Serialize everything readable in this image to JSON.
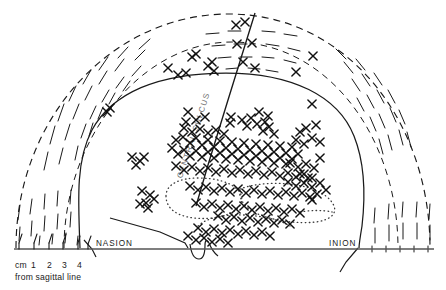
{
  "figure": {
    "kind": "anatomical-diagram",
    "view": "superior view of head, left hemisphere mapped",
    "background_color": "#ffffff",
    "ink_color": "#1a1a1a",
    "sulcus_label_color": "#6f6f6f"
  },
  "labels": {
    "nasion": "NASION",
    "inion": "INION",
    "central_sulcus": "CENTRAL SULCUS",
    "scale_unit": "cm",
    "scale_ticks": [
      "1",
      "2",
      "3",
      "4"
    ],
    "scale_caption": "from sagittal line"
  },
  "chart_data": {
    "type": "scatter",
    "title": "",
    "xlabel": "from sagittal line (cm)",
    "ylabel": "",
    "marker": "x-cross",
    "grid": false,
    "legend": null,
    "annotations": [
      {
        "text": "NASION",
        "x": 96,
        "y": 246
      },
      {
        "text": "INION",
        "x": 329,
        "y": 246
      },
      {
        "text": "CENTRAL SULCUS",
        "x": 196,
        "y": 110,
        "rotation": 67
      }
    ],
    "axis_ranges": {
      "x": [
        0,
        446
      ],
      "y": [
        0,
        290
      ]
    },
    "n_points": 186,
    "points": [
      [
        168,
        68
      ],
      [
        192,
        57
      ],
      [
        196,
        54
      ],
      [
        178,
        75
      ],
      [
        186,
        73
      ],
      [
        208,
        66
      ],
      [
        214,
        71
      ],
      [
        212,
        62
      ],
      [
        236,
        25
      ],
      [
        243,
        62
      ],
      [
        255,
        68
      ],
      [
        245,
        22
      ],
      [
        237,
        44
      ],
      [
        252,
        43
      ],
      [
        296,
        72
      ],
      [
        313,
        56
      ],
      [
        110,
        108
      ],
      [
        107,
        112
      ],
      [
        188,
        112
      ],
      [
        231,
        117
      ],
      [
        265,
        122
      ],
      [
        316,
        125
      ],
      [
        312,
        104
      ],
      [
        186,
        122
      ],
      [
        196,
        120
      ],
      [
        205,
        117
      ],
      [
        230,
        123
      ],
      [
        242,
        120
      ],
      [
        247,
        126
      ],
      [
        251,
        118
      ],
      [
        257,
        124
      ],
      [
        263,
        131
      ],
      [
        269,
        127
      ],
      [
        274,
        134
      ],
      [
        259,
        112
      ],
      [
        268,
        116
      ],
      [
        176,
        140
      ],
      [
        183,
        137
      ],
      [
        190,
        143
      ],
      [
        196,
        138
      ],
      [
        202,
        145
      ],
      [
        208,
        140
      ],
      [
        214,
        147
      ],
      [
        220,
        141
      ],
      [
        226,
        148
      ],
      [
        232,
        142
      ],
      [
        238,
        149
      ],
      [
        244,
        143
      ],
      [
        250,
        150
      ],
      [
        256,
        144
      ],
      [
        262,
        151
      ],
      [
        268,
        145
      ],
      [
        274,
        152
      ],
      [
        280,
        146
      ],
      [
        286,
        153
      ],
      [
        292,
        147
      ],
      [
        298,
        154
      ],
      [
        172,
        148
      ],
      [
        178,
        154
      ],
      [
        184,
        150
      ],
      [
        190,
        156
      ],
      [
        196,
        151
      ],
      [
        202,
        157
      ],
      [
        208,
        152
      ],
      [
        214,
        158
      ],
      [
        220,
        153
      ],
      [
        226,
        159
      ],
      [
        232,
        154
      ],
      [
        238,
        160
      ],
      [
        244,
        155
      ],
      [
        250,
        161
      ],
      [
        256,
        156
      ],
      [
        262,
        162
      ],
      [
        268,
        157
      ],
      [
        274,
        163
      ],
      [
        280,
        158
      ],
      [
        286,
        164
      ],
      [
        292,
        159
      ],
      [
        184,
        128
      ],
      [
        192,
        132
      ],
      [
        200,
        129
      ],
      [
        208,
        133
      ],
      [
        216,
        130
      ],
      [
        224,
        134
      ],
      [
        300,
        132
      ],
      [
        306,
        128
      ],
      [
        296,
        140
      ],
      [
        304,
        144
      ],
      [
        312,
        138
      ],
      [
        320,
        142
      ],
      [
        132,
        157
      ],
      [
        140,
        161
      ],
      [
        136,
        165
      ],
      [
        144,
        157
      ],
      [
        176,
        166
      ],
      [
        184,
        170
      ],
      [
        192,
        167
      ],
      [
        200,
        171
      ],
      [
        208,
        168
      ],
      [
        216,
        172
      ],
      [
        224,
        169
      ],
      [
        232,
        173
      ],
      [
        240,
        170
      ],
      [
        248,
        174
      ],
      [
        256,
        171
      ],
      [
        264,
        175
      ],
      [
        272,
        172
      ],
      [
        280,
        176
      ],
      [
        288,
        173
      ],
      [
        296,
        177
      ],
      [
        304,
        174
      ],
      [
        312,
        178
      ],
      [
        142,
        191
      ],
      [
        150,
        195
      ],
      [
        146,
        203
      ],
      [
        154,
        199
      ],
      [
        190,
        186
      ],
      [
        198,
        190
      ],
      [
        206,
        187
      ],
      [
        214,
        191
      ],
      [
        222,
        188
      ],
      [
        230,
        192
      ],
      [
        238,
        189
      ],
      [
        246,
        193
      ],
      [
        254,
        190
      ],
      [
        262,
        194
      ],
      [
        270,
        191
      ],
      [
        278,
        195
      ],
      [
        286,
        192
      ],
      [
        294,
        196
      ],
      [
        302,
        193
      ],
      [
        310,
        197
      ],
      [
        290,
        163
      ],
      [
        298,
        167
      ],
      [
        306,
        164
      ],
      [
        314,
        168
      ],
      [
        320,
        158
      ],
      [
        288,
        182
      ],
      [
        296,
        186
      ],
      [
        304,
        183
      ],
      [
        312,
        187
      ],
      [
        300,
        174
      ],
      [
        308,
        178
      ],
      [
        196,
        203
      ],
      [
        204,
        207
      ],
      [
        212,
        204
      ],
      [
        220,
        208
      ],
      [
        228,
        205
      ],
      [
        236,
        209
      ],
      [
        244,
        206
      ],
      [
        252,
        210
      ],
      [
        260,
        207
      ],
      [
        268,
        211
      ],
      [
        276,
        208
      ],
      [
        284,
        212
      ],
      [
        292,
        209
      ],
      [
        300,
        213
      ],
      [
        218,
        216
      ],
      [
        226,
        220
      ],
      [
        234,
        217
      ],
      [
        242,
        221
      ],
      [
        250,
        218
      ],
      [
        258,
        222
      ],
      [
        266,
        219
      ],
      [
        274,
        223
      ],
      [
        282,
        220
      ],
      [
        290,
        224
      ],
      [
        198,
        228
      ],
      [
        206,
        232
      ],
      [
        214,
        229
      ],
      [
        222,
        233
      ],
      [
        230,
        230
      ],
      [
        238,
        234
      ],
      [
        246,
        231
      ],
      [
        254,
        235
      ],
      [
        262,
        232
      ],
      [
        270,
        236
      ],
      [
        204,
        238
      ],
      [
        212,
        242
      ],
      [
        220,
        239
      ],
      [
        228,
        243
      ],
      [
        188,
        236
      ],
      [
        196,
        240
      ],
      [
        140,
        204
      ],
      [
        148,
        208
      ],
      [
        320,
        183
      ],
      [
        326,
        190
      ],
      [
        317,
        194
      ],
      [
        312,
        200
      ]
    ],
    "regions": [
      {
        "name": "scalp-outline-dashed",
        "style": "dashed-arc",
        "description": "outer dashed semicircular scalp contour"
      },
      {
        "name": "skull-brain-outline",
        "style": "solid",
        "description": "inner solid brain/skull contour"
      },
      {
        "name": "dotted-contour",
        "style": "dotted",
        "description": "dotted irregular region in lower central area"
      },
      {
        "name": "hatching-left",
        "style": "short-dashes",
        "description": "radial hatch marks between dashed and solid outlines, left"
      },
      {
        "name": "hatching-right",
        "style": "short-dashes",
        "description": "radial hatch marks between dashed and solid outlines, right"
      },
      {
        "name": "hatching-top",
        "style": "short-dashes",
        "description": "hatch marks along top of dashed arc near central sulcus"
      }
    ],
    "reference_lines": [
      {
        "name": "baseline-nasion-inion",
        "x1": 14,
        "y1": 249,
        "x2": 434,
        "y2": 249
      },
      {
        "name": "central-sulcus",
        "x1": 255,
        "y1": 13,
        "x2": 196,
        "y2": 206
      },
      {
        "name": "scale-ruler",
        "x1": 18,
        "y1": 249,
        "x2": 88,
        "y2": 249,
        "ticks": 5
      }
    ]
  }
}
